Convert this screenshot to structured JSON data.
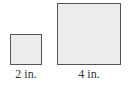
{
  "figure": {
    "squares": [
      {
        "label": "2 in.",
        "side_in": 2,
        "fill": "#ececec",
        "stroke": "#555555"
      },
      {
        "label": "4 in.",
        "side_in": 4,
        "fill": "#ececec",
        "stroke": "#555555"
      }
    ]
  }
}
